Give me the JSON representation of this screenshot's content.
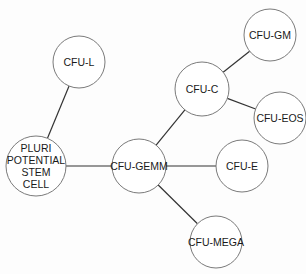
{
  "diagram": {
    "type": "hierarchy",
    "nodes": [
      {
        "id": "pluri",
        "lines": [
          "PLURI",
          "POTENTIAL",
          "STEM",
          "CELL"
        ],
        "cx": 36,
        "cy": 166,
        "r": 30
      },
      {
        "id": "cfu-l",
        "lines": [
          "CFU-L"
        ],
        "cx": 79,
        "cy": 62,
        "r": 26
      },
      {
        "id": "cfu-gemm",
        "lines": [
          "CFU-GEMM"
        ],
        "cx": 139,
        "cy": 166,
        "r": 27
      },
      {
        "id": "cfu-c",
        "lines": [
          "CFU-C"
        ],
        "cx": 202,
        "cy": 89,
        "r": 27
      },
      {
        "id": "cfu-gm",
        "lines": [
          "CFU-GM"
        ],
        "cx": 270,
        "cy": 35,
        "r": 26
      },
      {
        "id": "cfu-eos",
        "lines": [
          "CFU-EOS"
        ],
        "cx": 280,
        "cy": 118,
        "r": 26
      },
      {
        "id": "cfu-e",
        "lines": [
          "CFU-E"
        ],
        "cx": 242,
        "cy": 166,
        "r": 26
      },
      {
        "id": "cfu-mega",
        "lines": [
          "CFU-MEGA"
        ],
        "cx": 216,
        "cy": 242,
        "r": 26
      }
    ],
    "edges": [
      {
        "from": "pluri",
        "to": "cfu-l"
      },
      {
        "from": "pluri",
        "to": "cfu-gemm"
      },
      {
        "from": "cfu-gemm",
        "to": "cfu-c"
      },
      {
        "from": "cfu-gemm",
        "to": "cfu-e"
      },
      {
        "from": "cfu-gemm",
        "to": "cfu-mega"
      },
      {
        "from": "cfu-c",
        "to": "cfu-gm"
      },
      {
        "from": "cfu-c",
        "to": "cfu-eos"
      }
    ]
  }
}
